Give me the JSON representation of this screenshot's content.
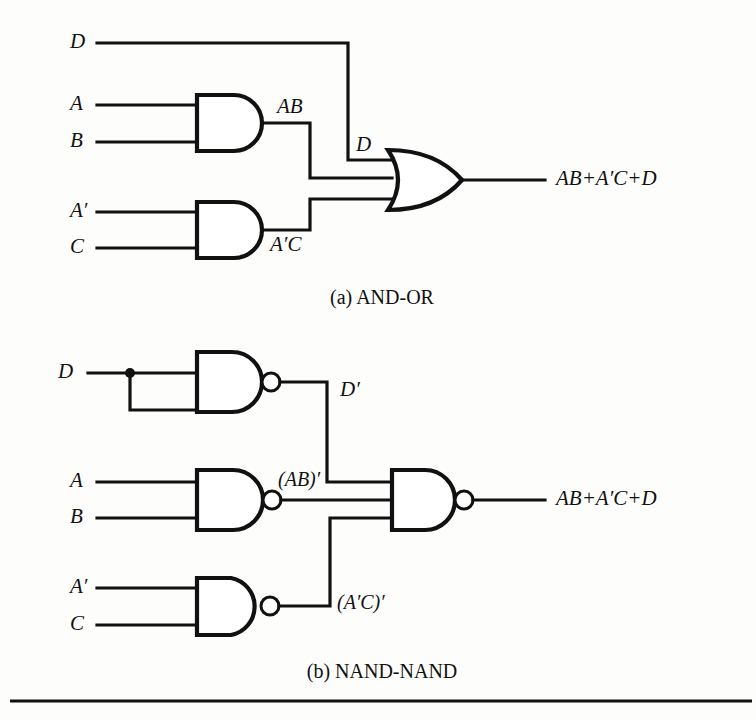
{
  "figure": {
    "background_color": "#fdfdfb",
    "ink_color": "#111111",
    "output_expression": "AB+A′C+D",
    "panels": [
      {
        "id": "panel-a",
        "caption": "(a) AND-OR",
        "type": "AND-OR",
        "inputs": [
          "D",
          "A",
          "B",
          "A′",
          "C"
        ],
        "intermediate_labels": [
          "AB",
          "A′C",
          "D"
        ],
        "output": "AB+A′C+D",
        "gates": [
          {
            "name": "and-gate-ab",
            "kind": "AND",
            "inputs": [
              "A",
              "B"
            ],
            "output": "AB"
          },
          {
            "name": "and-gate-apc",
            "kind": "AND",
            "inputs": [
              "A′",
              "C"
            ],
            "output": "A′C"
          },
          {
            "name": "or-gate-output",
            "kind": "OR",
            "inputs": [
              "D",
              "AB",
              "A′C"
            ],
            "output": "AB+A′C+D"
          }
        ]
      },
      {
        "id": "panel-b",
        "caption": "(b) NAND-NAND",
        "type": "NAND-NAND",
        "inputs": [
          "D",
          "A",
          "B",
          "A′",
          "C"
        ],
        "intermediate_labels": [
          "D′",
          "(AB)′",
          "(A′C)′"
        ],
        "output": "AB+A′C+D",
        "gates": [
          {
            "name": "nand-gate-d",
            "kind": "NAND",
            "inputs": [
              "D",
              "D"
            ],
            "output": "D′"
          },
          {
            "name": "nand-gate-ab",
            "kind": "NAND",
            "inputs": [
              "A",
              "B"
            ],
            "output": "(AB)′"
          },
          {
            "name": "nand-gate-apc",
            "kind": "NAND",
            "inputs": [
              "A′",
              "C"
            ],
            "output": "(A′C)′"
          },
          {
            "name": "nand-gate-output",
            "kind": "NAND",
            "inputs": [
              "D′",
              "(AB)′",
              "(A′C)′"
            ],
            "output": "AB+A′C+D"
          }
        ]
      }
    ],
    "labels": {
      "a_in_d": "D",
      "a_in_a": "A",
      "a_in_b": "B",
      "a_in_ap": "A′",
      "a_in_c": "C",
      "a_mid_ab": "AB",
      "a_mid_apc": "A′C",
      "a_mid_d": "D",
      "a_out": "AB+A′C+D",
      "caption_a": "(a) AND-OR",
      "b_in_d": "D",
      "b_in_a": "A",
      "b_in_b": "B",
      "b_in_ap": "A′",
      "b_in_c": "C",
      "b_mid_dp": "D′",
      "b_mid_abp": "(AB)′",
      "b_mid_apcp": "(A′C)′",
      "b_out": "AB+A′C+D",
      "caption_b": "(b) NAND-NAND"
    }
  }
}
